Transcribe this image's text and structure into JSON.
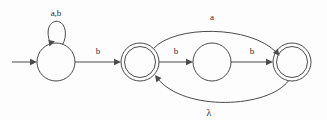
{
  "figure": {
    "type": "finite-state-automaton-diagram",
    "background_color": "#fdfdfd",
    "stroke_color": "#4a4a4a",
    "text_color": "#2b2b2b"
  },
  "states": [
    {
      "id": "q0",
      "kind": "start-state",
      "accepting": false,
      "shape": "single-circle",
      "cx": 56,
      "cy": 62,
      "r": 19,
      "label": ""
    },
    {
      "id": "q1",
      "kind": "accepting-state",
      "accepting": true,
      "shape": "double-circle",
      "cx": 140,
      "cy": 62,
      "r": 19,
      "label": ""
    },
    {
      "id": "q2",
      "kind": "normal-state",
      "accepting": false,
      "shape": "single-circle",
      "cx": 212,
      "cy": 62,
      "r": 19,
      "label": ""
    },
    {
      "id": "q3",
      "kind": "accepting-state",
      "accepting": true,
      "shape": "double-circle",
      "cx": 292,
      "cy": 62,
      "r": 19,
      "label": ""
    }
  ],
  "transitions": [
    {
      "id": "t-start",
      "from": "",
      "to": "q0",
      "label": "",
      "kind": "initial-arrow"
    },
    {
      "id": "t-self-q0",
      "from": "q0",
      "to": "q0",
      "label": "a,b",
      "kind": "self-loop",
      "label_x": 56,
      "label_y": 16
    },
    {
      "id": "t-q0-q1",
      "from": "q0",
      "to": "q1",
      "label": "b",
      "kind": "straight",
      "label_x": 98,
      "label_y": 54
    },
    {
      "id": "t-q1-q2",
      "from": "q1",
      "to": "q2",
      "label": "b",
      "kind": "straight",
      "label_x": 176,
      "label_y": 54
    },
    {
      "id": "t-q2-q3",
      "from": "q2",
      "to": "q3",
      "label": "b",
      "kind": "straight",
      "label_x": 252,
      "label_y": 54
    },
    {
      "id": "t-q1-q3",
      "from": "q1",
      "to": "q3",
      "label": "a",
      "kind": "curve-above",
      "label_x": 212,
      "label_y": 20
    },
    {
      "id": "t-q3-q1",
      "from": "q3",
      "to": "q1",
      "label": "λ",
      "kind": "curve-below",
      "label_x": 209,
      "label_y": 113
    }
  ],
  "alphabet": [
    "a",
    "b",
    "λ"
  ]
}
